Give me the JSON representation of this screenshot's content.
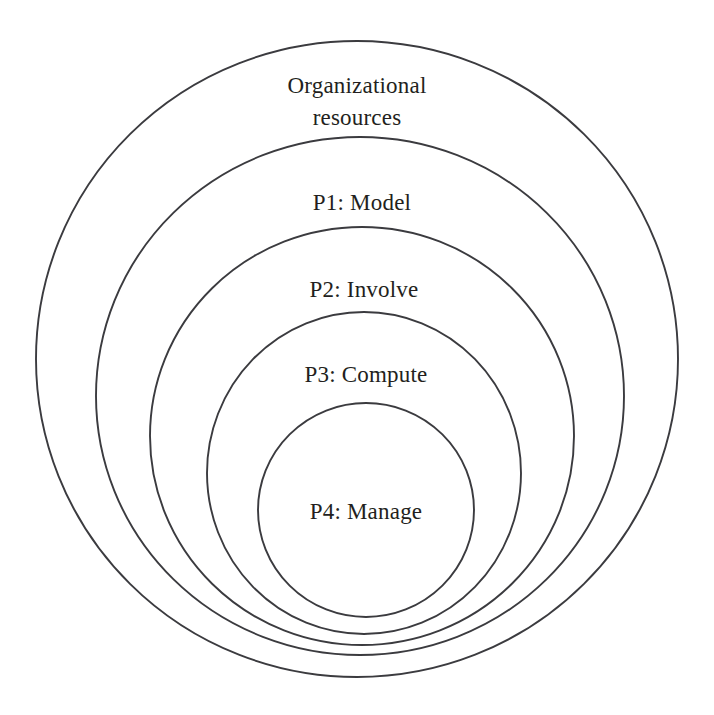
{
  "diagram": {
    "type": "nested-circles",
    "background_color": "#ffffff",
    "stroke_color": "#3b3b3f",
    "text_color": "#231f20",
    "canvas": {
      "width": 714,
      "height": 715
    },
    "rings": [
      {
        "id": "organizational-resources",
        "label": "Organizational",
        "label_line2": "resources",
        "label_full": "Organizational resources",
        "level": 0,
        "cx": 357,
        "cy": 359,
        "rx": 321,
        "ry": 318,
        "label_x": 357,
        "label_y": 88,
        "label_y2": 120
      },
      {
        "id": "p1-model",
        "label": "P1: Model",
        "level": 1,
        "cx": 360,
        "cy": 396,
        "rx": 264,
        "ry": 259,
        "label_x": 362,
        "label_y": 205
      },
      {
        "id": "p2-involve",
        "label": "P2: Involve",
        "level": 2,
        "cx": 362,
        "cy": 436,
        "rx": 212,
        "ry": 209,
        "label_x": 364,
        "label_y": 292
      },
      {
        "id": "p3-compute",
        "label": "P3: Compute",
        "level": 3,
        "cx": 364,
        "cy": 473,
        "rx": 157,
        "ry": 161,
        "label_x": 366,
        "label_y": 377
      },
      {
        "id": "p4-manage",
        "label": "P4: Manage",
        "level": 4,
        "cx": 366,
        "cy": 510,
        "rx": 108,
        "ry": 107,
        "label_x": 366,
        "label_y": 514
      }
    ]
  }
}
